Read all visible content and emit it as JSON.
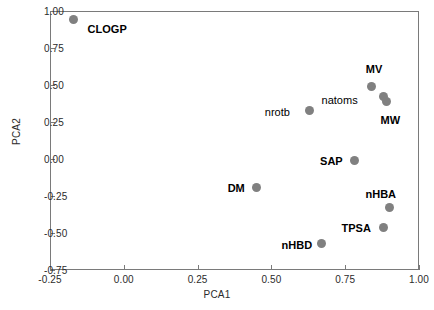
{
  "chart_data": {
    "type": "scatter",
    "title": "",
    "xlabel": "PCA1",
    "ylabel": "PCA2",
    "xlim": [
      -0.25,
      1.0
    ],
    "ylim": [
      -0.75,
      1.0
    ],
    "xticks": [
      "-0.25",
      "0.00",
      "0.25",
      "0.50",
      "0.75",
      "1.00"
    ],
    "xtick_values": [
      -0.25,
      0.0,
      0.25,
      0.5,
      0.75,
      1.0
    ],
    "yticks": [
      "-0.75",
      "-0.50",
      "-0.25",
      "0.00",
      "0.25",
      "0.50",
      "0.75",
      "1.00"
    ],
    "ytick_values": [
      -0.75,
      -0.5,
      -0.25,
      0.0,
      0.25,
      0.5,
      0.75,
      1.0
    ],
    "grid": false,
    "legend": "none",
    "marker_color": "#808080",
    "marker_shape": "circle",
    "points": [
      {
        "label": "CLOGP",
        "x": -0.17,
        "y": 0.94,
        "label_dx": 14,
        "label_dy": 10,
        "bold": true
      },
      {
        "label": "MV",
        "x": 0.84,
        "y": 0.49,
        "label_dx": -6,
        "label_dy": -16,
        "bold": true
      },
      {
        "label": "natoms",
        "x": 0.88,
        "y": 0.42,
        "label_dx": -62,
        "label_dy": 4,
        "bold": false
      },
      {
        "label": "MW",
        "x": 0.89,
        "y": 0.39,
        "label_dx": -6,
        "label_dy": 20,
        "bold": true
      },
      {
        "label": "nrotb",
        "x": 0.63,
        "y": 0.33,
        "label_dx": -45,
        "label_dy": 3,
        "bold": false
      },
      {
        "label": "SAP",
        "x": 0.78,
        "y": -0.01,
        "label_dx": -34,
        "label_dy": 2,
        "bold": true
      },
      {
        "label": "DM",
        "x": 0.45,
        "y": -0.19,
        "label_dx": -29,
        "label_dy": 2,
        "bold": true
      },
      {
        "label": "nHBA",
        "x": 0.9,
        "y": -0.33,
        "label_dx": -24,
        "label_dy": -13,
        "bold": true
      },
      {
        "label": "TPSA",
        "x": 0.88,
        "y": -0.46,
        "label_dx": -42,
        "label_dy": 2,
        "bold": true
      },
      {
        "label": "nHBD",
        "x": 0.67,
        "y": -0.57,
        "label_dx": -40,
        "label_dy": 3,
        "bold": true
      }
    ]
  }
}
